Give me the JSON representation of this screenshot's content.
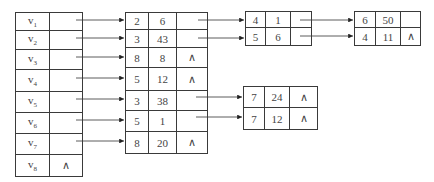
{
  "vertex_table": {
    "rows": [
      {
        "label": "v",
        "sub": "1",
        "pointer": ""
      },
      {
        "label": "v",
        "sub": "2",
        "pointer": ""
      },
      {
        "label": "v",
        "sub": "3",
        "pointer": ""
      },
      {
        "label": "v",
        "sub": "4",
        "pointer": ""
      },
      {
        "label": "v",
        "sub": "5",
        "pointer": ""
      },
      {
        "label": "v",
        "sub": "6",
        "pointer": ""
      },
      {
        "label": "v",
        "sub": "7",
        "pointer": ""
      },
      {
        "label": "v",
        "sub": "8",
        "pointer": "∧"
      }
    ]
  },
  "first_nodes": {
    "rows": [
      {
        "a": "2",
        "b": "6",
        "next": ""
      },
      {
        "a": "3",
        "b": "43",
        "next": ""
      },
      {
        "a": "8",
        "b": "8",
        "next": "∧"
      },
      {
        "a": "5",
        "b": "12",
        "next": "∧"
      },
      {
        "a": "3",
        "b": "38",
        "next": ""
      },
      {
        "a": "5",
        "b": "1",
        "next": ""
      },
      {
        "a": "8",
        "b": "20",
        "next": "∧"
      }
    ]
  },
  "second_nodes_top": {
    "rows": [
      {
        "a": "4",
        "b": "1",
        "next": ""
      },
      {
        "a": "5",
        "b": "6",
        "next": ""
      }
    ]
  },
  "third_nodes_top": {
    "rows": [
      {
        "a": "6",
        "b": "50",
        "next": ""
      },
      {
        "a": "4",
        "b": "11",
        "next": "∧"
      }
    ]
  },
  "second_nodes_mid": {
    "rows": [
      {
        "a": "7",
        "b": "24",
        "next": "∧"
      },
      {
        "a": "7",
        "b": "12",
        "next": "∧"
      }
    ]
  }
}
